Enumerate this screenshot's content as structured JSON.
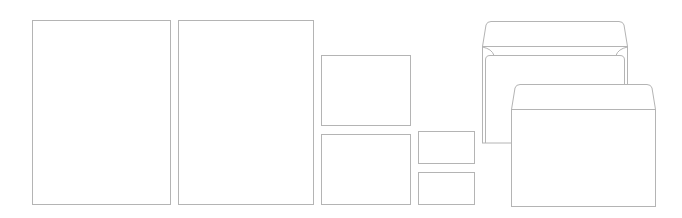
{
  "mockup": {
    "stroke_color": "#b4b4b4",
    "background_color": "#ffffff",
    "items": [
      {
        "name": "letterhead-sheet-1",
        "x": 32,
        "y": 20,
        "w": 139,
        "h": 185
      },
      {
        "name": "letterhead-sheet-2",
        "x": 178,
        "y": 20,
        "w": 136,
        "h": 185
      },
      {
        "name": "card-large-top",
        "x": 321,
        "y": 55,
        "w": 90,
        "h": 71
      },
      {
        "name": "card-large-bottom",
        "x": 321,
        "y": 134,
        "w": 90,
        "h": 71
      },
      {
        "name": "business-card-top",
        "x": 418,
        "y": 131,
        "w": 57,
        "h": 33
      },
      {
        "name": "business-card-bottom",
        "x": 418,
        "y": 172,
        "w": 57,
        "h": 33
      }
    ],
    "envelopes": [
      {
        "name": "envelope-back-open",
        "x": 482,
        "y": 21,
        "w": 145,
        "h": 122
      },
      {
        "name": "envelope-front",
        "x": 511,
        "y": 84,
        "w": 145,
        "h": 123
      }
    ]
  }
}
